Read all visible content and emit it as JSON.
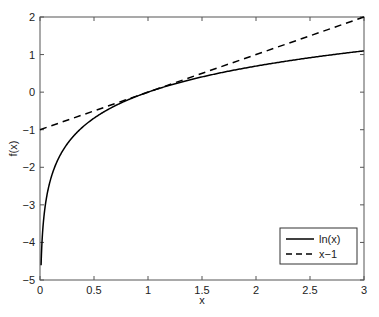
{
  "chart_data": {
    "type": "line",
    "title": "",
    "xlabel": "x",
    "ylabel": "f(x)",
    "xlim": [
      0,
      3
    ],
    "ylim": [
      -5,
      2
    ],
    "grid": false,
    "legend_position": "lower right",
    "x_ticks": [
      "0",
      "0.5",
      "1",
      "1.5",
      "2",
      "2.5",
      "3"
    ],
    "y_ticks": [
      "-5",
      "-4",
      "-3",
      "-2",
      "-1",
      "0",
      "1",
      "2"
    ],
    "series": [
      {
        "name": "ln(x)",
        "style": "solid",
        "color": "#000000",
        "x": [
          0.01,
          0.05,
          0.1,
          0.2,
          0.3,
          0.5,
          0.75,
          1.0,
          1.5,
          2.0,
          2.5,
          3.0
        ],
        "values": [
          -4.61,
          -3.0,
          -2.3,
          -1.61,
          -1.2,
          -0.69,
          -0.29,
          0.0,
          0.41,
          0.69,
          0.92,
          1.1
        ]
      },
      {
        "name": "x−1",
        "style": "dashed",
        "color": "#000000",
        "x": [
          0,
          3
        ],
        "values": [
          -1,
          2
        ]
      }
    ]
  },
  "legend": {
    "items": [
      {
        "label": "ln(x)",
        "style": "solid"
      },
      {
        "label": "x−1",
        "style": "dashed"
      }
    ]
  }
}
